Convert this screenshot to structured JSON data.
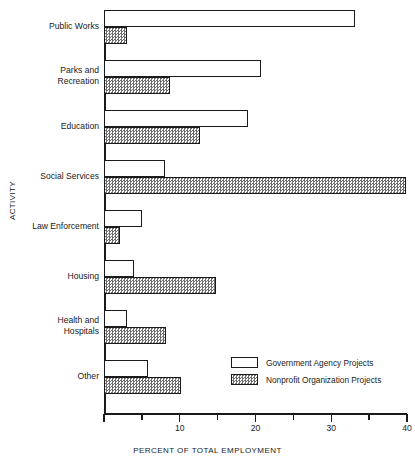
{
  "chart_data": {
    "type": "bar",
    "orientation": "horizontal",
    "title": "",
    "xlabel": "PERCENT OF TOTAL EMPLOYMENT",
    "ylabel": "ACTIVITY",
    "xlim": [
      0,
      40
    ],
    "grid": false,
    "legend_position": "inside-bottom-right",
    "x_major_ticks": [
      0,
      10,
      20,
      30,
      40
    ],
    "x_minor_ticks": [
      5,
      15,
      25,
      35
    ],
    "x_tick_labels": [
      "",
      "10",
      "20",
      "30",
      "40"
    ],
    "categories": [
      "Public Works",
      "Parks and\nRecreation",
      "Education",
      "Social Services",
      "Law Enforcement",
      "Housing",
      "Health and\nHospitals",
      "Other"
    ],
    "series": [
      {
        "name": "Government Agency Projects",
        "fill": "white",
        "values": [
          33.2,
          20.7,
          19.0,
          8.0,
          5.0,
          4.0,
          3.0,
          5.8
        ]
      },
      {
        "name": "Nonprofit Organization Projects",
        "fill": "hatched-gray",
        "values": [
          3.0,
          8.7,
          12.7,
          39.9,
          2.1,
          14.8,
          8.2,
          10.2
        ]
      }
    ]
  },
  "legend": {
    "items": [
      {
        "label": "Government Agency Projects",
        "swatch": "white"
      },
      {
        "label": "Nonprofit Organization Projects",
        "swatch": "hatched-gray"
      }
    ]
  },
  "colors": {
    "ink": "#1a1a1a",
    "background": "#ffffff",
    "hatch_gray": "#6e6e6e"
  }
}
